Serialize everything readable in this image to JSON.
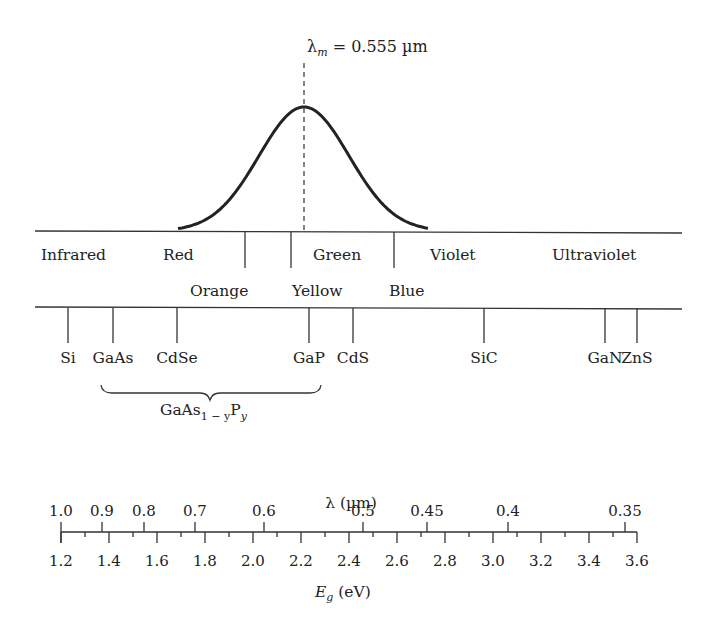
{
  "peak": {
    "label_symbol": "λ",
    "label_sub": "m",
    "label_rest": " = 0.555 µm",
    "x": 304,
    "y": 107,
    "start_x": 178,
    "end_x": 428
  },
  "spectrum": {
    "line_y": 231,
    "line_x1": 35,
    "line_x2": 682,
    "dividers": [
      245,
      291,
      394
    ],
    "bands_top": [
      {
        "label": "Infrared",
        "x": 41
      },
      {
        "label": "Red",
        "x": 163
      },
      {
        "label": "Green",
        "x": 313
      },
      {
        "label": "Violet",
        "x": 430
      },
      {
        "label": "Ultraviolet",
        "x": 552
      }
    ],
    "bands_bottom": [
      {
        "label": "Orange",
        "x": 190
      },
      {
        "label": "Yellow",
        "x": 292
      },
      {
        "label": "Blue",
        "x": 389
      }
    ]
  },
  "materials": {
    "line_y": 307,
    "items": [
      {
        "label": "Si",
        "x": 68
      },
      {
        "label": "GaAs",
        "x": 113
      },
      {
        "label": "CdSe",
        "x": 177
      },
      {
        "label": "GaP",
        "x": 309
      },
      {
        "label": "CdS",
        "x": 353
      },
      {
        "label": "SiC",
        "x": 484
      },
      {
        "label": "GaN",
        "x": 605
      },
      {
        "label": "ZnS",
        "x": 637
      }
    ],
    "alloy": {
      "base": "GaAs",
      "sub1": "1 − y",
      "mid": "P",
      "sub2": "y",
      "brace_x1": 101,
      "brace_x2": 321
    }
  },
  "chart_data": {
    "type": "table",
    "title": "",
    "top_axis": {
      "label": "λ (µm)",
      "ticks": [
        "1.0",
        "0.9",
        "0.8",
        "0.7",
        "0.6",
        "0.5",
        "0.45",
        "0.4",
        "0.35"
      ],
      "tick_x": [
        61,
        102,
        144,
        195,
        264,
        363,
        427,
        508,
        625
      ]
    },
    "bottom_axis": {
      "label_main": "E",
      "label_sub": "g",
      "label_rest": " (eV)",
      "ticks": [
        "1.2",
        "1.4",
        "1.6",
        "1.8",
        "2.0",
        "2.2",
        "2.4",
        "2.6",
        "2.8",
        "3.0",
        "3.2",
        "3.4",
        "3.6"
      ],
      "range": [
        1.2,
        3.6
      ],
      "x_start": 61,
      "x_end": 637
    },
    "peak_wavelength_um": 0.555,
    "materials_bandgap_order": [
      "Si",
      "GaAs",
      "CdSe",
      "GaP",
      "CdS",
      "SiC",
      "GaN",
      "ZnS"
    ]
  }
}
